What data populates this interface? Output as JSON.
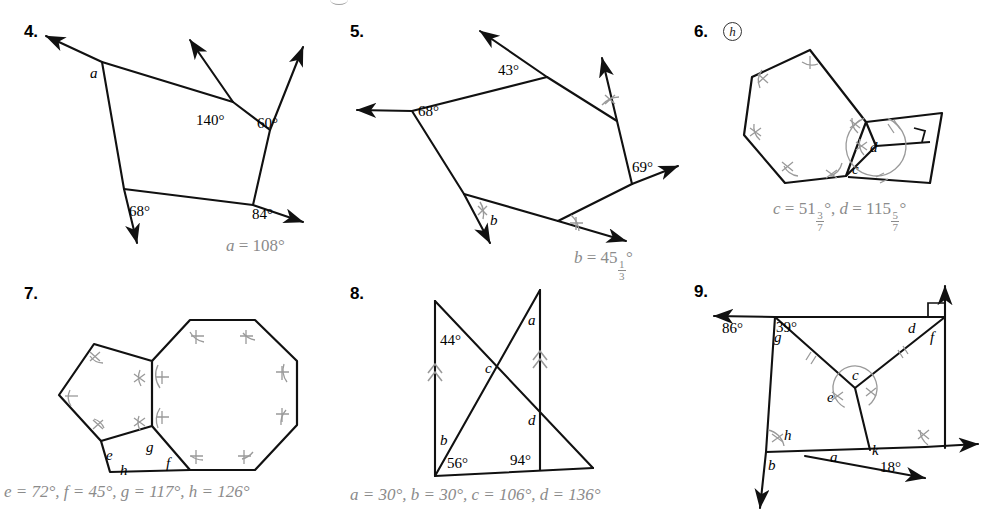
{
  "page": {
    "width": 986,
    "height": 521,
    "ink_color": "#111111",
    "answer_color": "#8b8b8b",
    "background": "#ffffff"
  },
  "problems": [
    {
      "number": "4.",
      "hint_icon": null,
      "angle_labels": [
        "a",
        "140°",
        "60°",
        "68°",
        "84°"
      ],
      "answer": {
        "var": "a",
        "eq": "=",
        "value": "108°"
      },
      "answer_plain": "a = 108°"
    },
    {
      "number": "5.",
      "hint_icon": null,
      "angle_labels": [
        "43°",
        "68°",
        "69°",
        "b"
      ],
      "answer": {
        "var": "b",
        "eq": "=",
        "whole": "45",
        "num": "1",
        "den": "3",
        "deg": "°"
      },
      "answer_plain": "b = 45 1/3°"
    },
    {
      "number": "6.",
      "hint_icon": "h",
      "angle_labels": [
        "c",
        "d"
      ],
      "answer_parts": [
        {
          "var": "c",
          "eq": "=",
          "whole": "51",
          "num": "3",
          "den": "7",
          "deg": "°"
        },
        {
          "var": "d",
          "eq": "=",
          "whole": "115",
          "num": "5",
          "den": "7",
          "deg": "°"
        }
      ],
      "answer_plain": "c = 51 3/7°, d = 115 5/7°"
    },
    {
      "number": "7.",
      "hint_icon": null,
      "angle_labels": [
        "e",
        "f",
        "g",
        "h"
      ],
      "answer_parts": [
        {
          "var": "e",
          "eq": "=",
          "value": "72°"
        },
        {
          "var": "f",
          "eq": "=",
          "value": "45°"
        },
        {
          "var": "g",
          "eq": "=",
          "value": "117°"
        },
        {
          "var": "h",
          "eq": "=",
          "value": "126°"
        }
      ],
      "answer_plain": "e = 72°, f = 45°, g = 117°, h = 126°"
    },
    {
      "number": "8.",
      "hint_icon": null,
      "angle_labels": [
        "44°",
        "a",
        "c",
        "d",
        "b",
        "56°",
        "94°"
      ],
      "answer_parts": [
        {
          "var": "a",
          "eq": "=",
          "value": "30°"
        },
        {
          "var": "b",
          "eq": "=",
          "value": "30°"
        },
        {
          "var": "c",
          "eq": "=",
          "value": "106°"
        },
        {
          "var": "d",
          "eq": "=",
          "value": "136°"
        }
      ],
      "answer_plain": "a = 30°, b = 30°, c = 106°, d = 136°"
    },
    {
      "number": "9.",
      "hint_icon": null,
      "angle_labels": [
        "86°",
        "39°",
        "g",
        "d",
        "f",
        "c",
        "e",
        "h",
        "b",
        "a",
        "k",
        "18°"
      ],
      "answer_parts": [],
      "answer_plain": ""
    }
  ],
  "p4": {
    "num": "4.",
    "l_a": "a",
    "l_140": "140°",
    "l_60": "60°",
    "l_68": "68°",
    "l_84": "84°",
    "ans_var": "a",
    "ans_eq": "=",
    "ans_val": "108°"
  },
  "p5": {
    "num": "5.",
    "l_43": "43°",
    "l_68": "68°",
    "l_69": "69°",
    "l_b": "b",
    "ans_var": "b",
    "ans_eq": "=",
    "ans_whole": "45",
    "ans_num": "1",
    "ans_den": "3",
    "ans_deg": "°"
  },
  "p6": {
    "num": "6.",
    "hint": "h",
    "l_c": "c",
    "l_d": "d",
    "ans_c_var": "c",
    "ans_c_eq": "=",
    "ans_c_whole": "51",
    "ans_c_num": "3",
    "ans_c_den": "7",
    "ans_c_deg": "°",
    "ans_sep": ",",
    "ans_d_var": "d",
    "ans_d_eq": "=",
    "ans_d_whole": "115",
    "ans_d_num": "5",
    "ans_d_den": "7",
    "ans_d_deg": "°"
  },
  "p7": {
    "num": "7.",
    "l_e": "e",
    "l_f": "f",
    "l_g": "g",
    "l_h": "h",
    "ans": "e = 72°, f = 45°, g = 117°, h = 126°"
  },
  "p8": {
    "num": "8.",
    "l_44": "44°",
    "l_a": "a",
    "l_c": "c",
    "l_d": "d",
    "l_b": "b",
    "l_56": "56°",
    "l_94": "94°",
    "ans": "a = 30°, b = 30°, c = 106°, d = 136°"
  },
  "p9": {
    "num": "9.",
    "l_86": "86°",
    "l_39": "39°",
    "l_g": "g",
    "l_d": "d",
    "l_f": "f",
    "l_c": "c",
    "l_e": "e",
    "l_h": "h",
    "l_b": "b",
    "l_a": "a",
    "l_k": "k",
    "l_18": "18°"
  }
}
